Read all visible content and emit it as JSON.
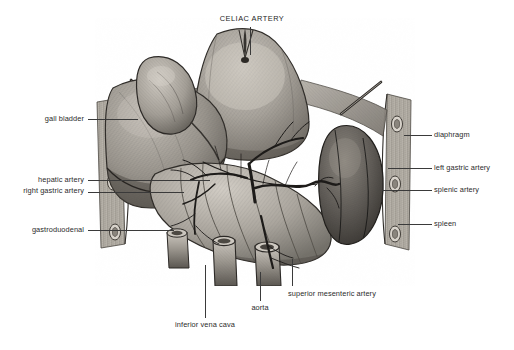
{
  "figure": {
    "title": "CELIAC ARTERY",
    "style": "grayscale engraving / stipple-hatched medical illustration",
    "background_color": "#ffffff",
    "ink_color": "#2b2b2b",
    "width": 514,
    "height": 350
  },
  "labels": {
    "celiac_artery": "CELIAC ARTERY",
    "gall_bladder": "gall bladder",
    "hepatic_artery": "hepatic artery",
    "right_gastric_artery": "right gastric artery",
    "gastroduodenal": "gastroduodenal",
    "diaphragm": "diaphragm",
    "left_gastric_artery": "left gastric artery",
    "splenic_artery": "splenic artery",
    "spleen": "spleen",
    "superior_mesenteric_artery": "superior mesenteric artery",
    "aorta": "aorta",
    "inferior_vena_cava": "inferior vena cava"
  },
  "structures": [
    "stomach",
    "liver",
    "gall bladder",
    "spleen",
    "duodenum",
    "diaphragm",
    "aorta",
    "inferior vena cava",
    "celiac trunk"
  ]
}
